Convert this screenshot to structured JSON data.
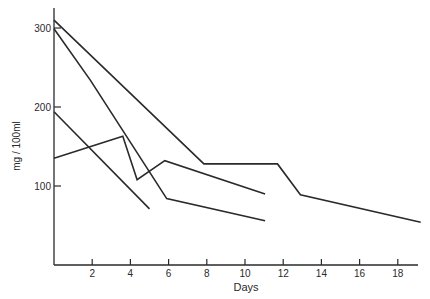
{
  "chart_data": {
    "type": "line",
    "title": "",
    "xlabel": "Days",
    "ylabel": "mg / 100ml",
    "xlim": [
      0,
      19.5
    ],
    "ylim": [
      0,
      325
    ],
    "xticks": [
      2,
      4,
      6,
      8,
      10,
      12,
      14,
      16,
      18
    ],
    "yticks": [
      100,
      200,
      300
    ],
    "grid": false,
    "legend": null,
    "series": [
      {
        "name": "Series 1",
        "points": [
          [
            0,
            310
          ],
          [
            7.85,
            128
          ],
          [
            11.7,
            128
          ],
          [
            12.9,
            89
          ],
          [
            19.2,
            54
          ]
        ]
      },
      {
        "name": "Series 2",
        "points": [
          [
            0,
            299
          ],
          [
            1.9,
            234
          ],
          [
            5.9,
            84
          ],
          [
            11.05,
            56
          ]
        ]
      },
      {
        "name": "Series 3",
        "points": [
          [
            0,
            135
          ],
          [
            3.6,
            163
          ],
          [
            4.35,
            108
          ],
          [
            5.8,
            132
          ],
          [
            11.05,
            90
          ]
        ]
      },
      {
        "name": "Series 4",
        "points": [
          [
            0,
            194
          ],
          [
            5.0,
            71
          ]
        ]
      }
    ]
  },
  "style": {
    "line_color": "#2a2a2a",
    "axis_color": "#2a2a2a",
    "background": "#ffffff"
  }
}
